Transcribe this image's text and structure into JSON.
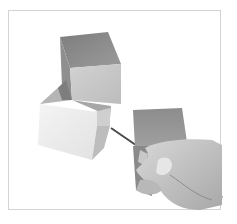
{
  "illustration": {
    "subject": "hand with pencil shading three cubes",
    "elements": [
      "top-cube",
      "bottom-left-cube",
      "right-block",
      "hand",
      "pencil"
    ]
  },
  "colors": {
    "background": "#ffffff",
    "frame_border": "#d4d4d4",
    "cube_top_dark": "#8a8a8a",
    "cube_face_light": "#c9c9c9",
    "cube_face_white": "#eeeeee",
    "cube_face_mid": "#a9a9a9",
    "hand_skin": "#cfcfcf",
    "hand_shadow": "#9a9a9a",
    "pencil": "#2a2a2a"
  }
}
